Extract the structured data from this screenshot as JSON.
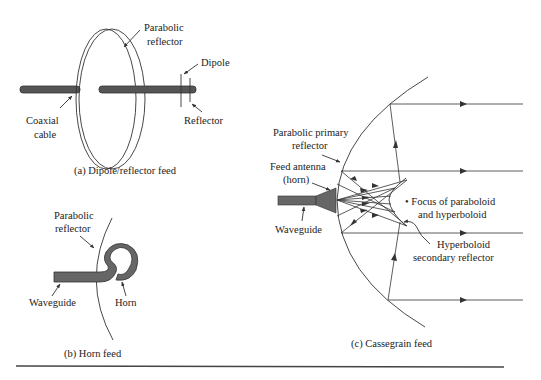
{
  "figure": {
    "panel_a": {
      "caption": "(a) Dipole/reflector feed",
      "labels": {
        "parabolic_reflector_1": "Parabolic",
        "parabolic_reflector_2": "reflector",
        "dipole": "Dipole",
        "coaxial_cable_1": "Coaxial",
        "coaxial_cable_2": "cable",
        "reflector": "Reflector"
      }
    },
    "panel_b": {
      "caption": "(b) Horn feed",
      "labels": {
        "parabolic_reflector_1": "Parabolic",
        "parabolic_reflector_2": "reflector",
        "waveguide": "Waveguide",
        "horn": "Horn"
      }
    },
    "panel_c": {
      "caption": "(c) Cassegrain feed",
      "labels": {
        "primary_reflector_1": "Parabolic primary",
        "primary_reflector_2": "reflector",
        "feed_antenna_1": "Feed antenna",
        "feed_antenna_2": "(horn)",
        "waveguide": "Waveguide",
        "focus_1": "• Focus of paraboloid",
        "focus_2": "and hyperboloid",
        "hyperboloid_1": "Hyperboloid",
        "hyperboloid_2": "secondary reflector"
      }
    },
    "colors": {
      "line": "#333333",
      "fill": "#555555",
      "background": "#ffffff"
    }
  }
}
